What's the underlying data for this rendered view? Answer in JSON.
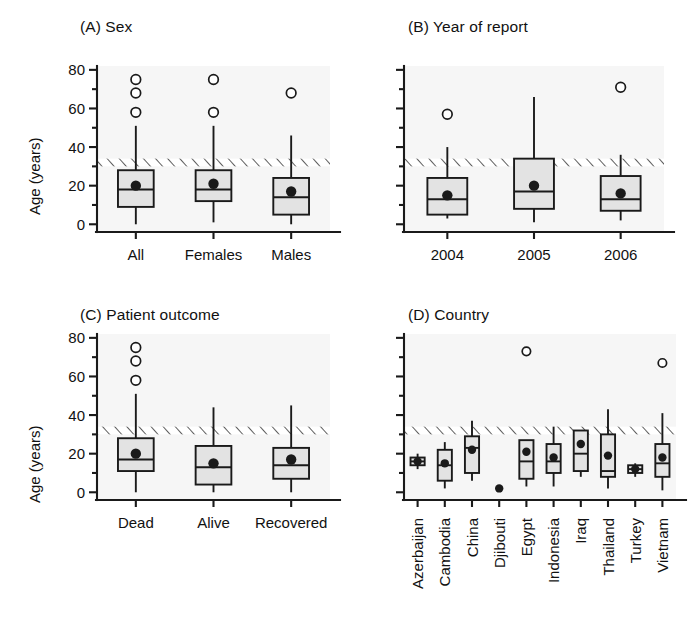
{
  "figure": {
    "ylabel": "Age (years)",
    "colors": {
      "box_fill": "#e3e3e3",
      "line": "#1a1a1a",
      "plot_bg": "#f6f6f6",
      "hatch": "#555555"
    },
    "y_ticks": [
      0,
      20,
      40,
      60,
      80
    ],
    "y_minor_step": 10,
    "ylim": [
      -4,
      82
    ],
    "reference_band": {
      "low": 30,
      "high": 34,
      "style": "hatched"
    }
  },
  "chart_data": [
    {
      "type": "box",
      "panel": "A",
      "title": "(A) Sex",
      "xlabel": "",
      "ylabel": "Age (years)",
      "ylim": [
        -4,
        82
      ],
      "yticks": [
        0,
        20,
        40,
        60,
        80
      ],
      "grid": false,
      "reference_band": [
        30,
        34
      ],
      "categories": [
        "All",
        "Females",
        "Males"
      ],
      "boxes": [
        {
          "category": "All",
          "whisker_low": 0,
          "q1": 9,
          "median": 18,
          "q3": 28,
          "whisker_high": 51,
          "mean": 20.0,
          "outliers": [
            58,
            68,
            75
          ]
        },
        {
          "category": "Females",
          "whisker_low": 1,
          "q1": 12,
          "median": 18,
          "q3": 28,
          "whisker_high": 51,
          "mean": 21.0,
          "outliers": [
            58,
            75
          ]
        },
        {
          "category": "Males",
          "whisker_low": 0,
          "q1": 5,
          "median": 14,
          "q3": 24,
          "whisker_high": 46,
          "mean": 17.0,
          "outliers": [
            68
          ]
        }
      ]
    },
    {
      "type": "box",
      "panel": "B",
      "title": "(B) Year of report",
      "xlabel": "",
      "ylabel": "",
      "ylim": [
        -4,
        82
      ],
      "yticks": [
        0,
        20,
        40,
        60,
        80
      ],
      "grid": false,
      "reference_band": [
        30,
        34
      ],
      "categories": [
        "2004",
        "2005",
        "2006"
      ],
      "boxes": [
        {
          "category": "2004",
          "whisker_low": 3,
          "q1": 5,
          "median": 13,
          "q3": 24,
          "whisker_high": 40,
          "mean": 15.0,
          "outliers": [
            57
          ]
        },
        {
          "category": "2005",
          "whisker_low": 1,
          "q1": 8,
          "median": 17,
          "q3": 34,
          "whisker_high": 66,
          "mean": 20.0,
          "outliers": []
        },
        {
          "category": "2006",
          "whisker_low": 2,
          "q1": 7,
          "median": 13,
          "q3": 25,
          "whisker_high": 36,
          "mean": 16.0,
          "outliers": [
            71
          ]
        }
      ]
    },
    {
      "type": "box",
      "panel": "C",
      "title": "(C) Patient outcome",
      "xlabel": "",
      "ylabel": "Age (years)",
      "ylim": [
        -4,
        82
      ],
      "yticks": [
        0,
        20,
        40,
        60,
        80
      ],
      "grid": false,
      "reference_band": [
        30,
        34
      ],
      "categories": [
        "Dead",
        "Alive",
        "Recovered"
      ],
      "boxes": [
        {
          "category": "Dead",
          "whisker_low": 0,
          "q1": 11,
          "median": 17,
          "q3": 28,
          "whisker_high": 51,
          "mean": 20.0,
          "outliers": [
            58,
            68,
            75
          ]
        },
        {
          "category": "Alive",
          "whisker_low": 0,
          "q1": 4,
          "median": 13,
          "q3": 24,
          "whisker_high": 44,
          "mean": 15.0,
          "outliers": []
        },
        {
          "category": "Recovered",
          "whisker_low": 0,
          "q1": 7,
          "median": 14,
          "q3": 23,
          "whisker_high": 45,
          "mean": 17.0,
          "outliers": []
        }
      ]
    },
    {
      "type": "box",
      "panel": "D",
      "title": "(D) Country",
      "xlabel": "",
      "ylabel": "",
      "ylim": [
        -4,
        82
      ],
      "yticks": [
        0,
        20,
        40,
        60,
        80
      ],
      "grid": false,
      "reference_band": [
        30,
        34
      ],
      "categories": [
        "Azerbaijan",
        "Cambodia",
        "China",
        "Djibouti",
        "Egypt",
        "Indonesia",
        "Iraq",
        "Thailand",
        "Turkey",
        "Vietnam"
      ],
      "boxes": [
        {
          "category": "Azerbaijan",
          "whisker_low": 12,
          "q1": 14,
          "median": 16,
          "q3": 18,
          "whisker_high": 20,
          "mean": 16.0,
          "outliers": []
        },
        {
          "category": "Cambodia",
          "whisker_low": 2,
          "q1": 6,
          "median": 14,
          "q3": 22,
          "whisker_high": 26,
          "mean": 15.0,
          "outliers": []
        },
        {
          "category": "China",
          "whisker_low": 6,
          "q1": 10,
          "median": 23,
          "q3": 29,
          "whisker_high": 37,
          "mean": 22.0,
          "outliers": []
        },
        {
          "category": "Djibouti",
          "whisker_low": 2,
          "q1": 2,
          "median": 2,
          "q3": 2,
          "whisker_high": 2,
          "mean": 2.0,
          "outliers": []
        },
        {
          "category": "Egypt",
          "whisker_low": 3,
          "q1": 7,
          "median": 16,
          "q3": 27,
          "whisker_high": 27,
          "mean": 21.0,
          "outliers": [
            73
          ]
        },
        {
          "category": "Indonesia",
          "whisker_low": 3,
          "q1": 10,
          "median": 16,
          "q3": 25,
          "whisker_high": 34,
          "mean": 18.0,
          "outliers": []
        },
        {
          "category": "Iraq",
          "whisker_low": 8,
          "q1": 11,
          "median": 20,
          "q3": 32,
          "whisker_high": 32,
          "mean": 25.0,
          "outliers": []
        },
        {
          "category": "Thailand",
          "whisker_low": 2,
          "q1": 8,
          "median": 11,
          "q3": 30,
          "whisker_high": 43,
          "mean": 19.0,
          "outliers": []
        },
        {
          "category": "Turkey",
          "whisker_low": 8,
          "q1": 10,
          "median": 12,
          "q3": 14,
          "whisker_high": 15,
          "mean": 12.0,
          "outliers": []
        },
        {
          "category": "Vietnam",
          "whisker_low": 1,
          "q1": 8,
          "median": 15,
          "q3": 25,
          "whisker_high": 41,
          "mean": 18.0,
          "outliers": [
            67
          ]
        }
      ]
    }
  ]
}
